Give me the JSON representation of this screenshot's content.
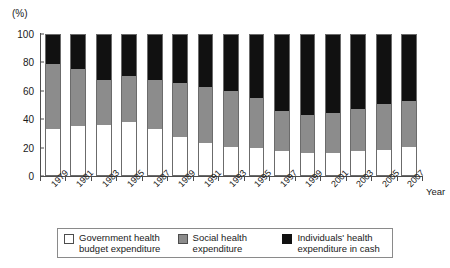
{
  "chart_data": {
    "type": "bar",
    "stacked": true,
    "stacked_mode": "percent",
    "title": "",
    "xlabel": "Year",
    "ylabel": "(%)",
    "ylim": [
      0,
      100
    ],
    "yticks": [
      0,
      20,
      40,
      60,
      80,
      100
    ],
    "grid": false,
    "legend_position": "bottom",
    "categories": [
      "1979",
      "1981",
      "1983",
      "1985",
      "1987",
      "1989",
      "1991",
      "1993",
      "1995",
      "1997",
      "1999",
      "2001",
      "2003",
      "2005",
      "2007"
    ],
    "series": [
      {
        "name": "Government health budget expenditure",
        "color": "#ffffff",
        "values": [
          33,
          35,
          36,
          38,
          33,
          27,
          23,
          20,
          19,
          17,
          16,
          16,
          17,
          18,
          20
        ]
      },
      {
        "name": "Social health expenditure",
        "color": "#8c8c8c",
        "values": [
          46,
          41,
          32,
          33,
          35,
          39,
          40,
          40,
          36,
          29,
          27,
          28,
          30,
          33,
          33
        ]
      },
      {
        "name": "Individuals' health expenditure in cash",
        "color": "#111111",
        "values": [
          21,
          24,
          32,
          29,
          32,
          34,
          37,
          40,
          45,
          54,
          57,
          56,
          53,
          49,
          47
        ]
      }
    ]
  },
  "axes": {
    "y_unit": "(%)",
    "y_ticks": [
      "100",
      "80",
      "60",
      "40",
      "20",
      "0"
    ],
    "x_title": "Year",
    "x_ticks": [
      "1979",
      "1981",
      "1983",
      "1985",
      "1987",
      "1989",
      "1991",
      "1993",
      "1995",
      "1997",
      "1999",
      "2001",
      "2003",
      "2005",
      "2007"
    ]
  },
  "legend": {
    "items": [
      {
        "label": "Government health budget expenditure",
        "swatch": "white"
      },
      {
        "label": "Social health expenditure",
        "swatch": "gray"
      },
      {
        "label": "Individuals' health expenditure in cash",
        "swatch": "black"
      }
    ]
  },
  "colors": {
    "government": "#ffffff",
    "social": "#8c8c8c",
    "individual": "#111111",
    "axis": "#4d4d4d"
  }
}
